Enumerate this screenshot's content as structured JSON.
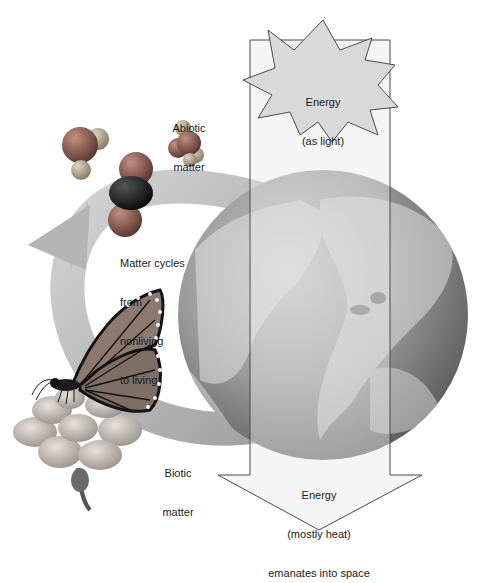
{
  "diagram": {
    "energy_in": {
      "line1": "Energy",
      "line2": "(as light)"
    },
    "abiotic": {
      "line1": "Abiotic",
      "line2": "matter"
    },
    "cycle": {
      "line1": "Matter cycles",
      "line2": "from",
      "line3": "nonliving",
      "line4": "to living"
    },
    "biotic": {
      "line1": "Biotic",
      "line2": "matter"
    },
    "energy_out": {
      "line1": "Energy",
      "line2": "(mostly heat)",
      "line3": "emanates into space"
    }
  },
  "colors": {
    "background": "#ffffff",
    "arrow_fill": "#d9d9d9",
    "arrow_stroke": "#5a5a5a",
    "globe_dark": "#6e6e6e",
    "globe_light": "#b5b5b5",
    "cycle_arrow": "#bdbdbd",
    "molecule_red": "#8a5a50",
    "molecule_dark": "#262626",
    "molecule_light": "#b0a28a",
    "butterfly_wing": "#8c7a70",
    "butterfly_vein": "#141414",
    "flower": "#c4bdb8"
  }
}
